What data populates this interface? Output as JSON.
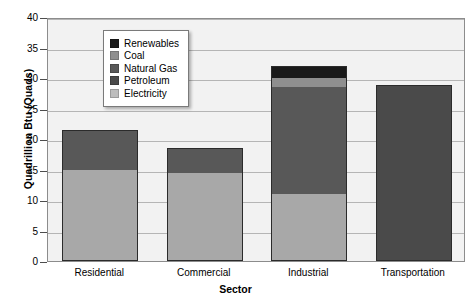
{
  "chart_data": {
    "type": "bar",
    "subtype": "stacked",
    "title": "",
    "xlabel": "Sector",
    "ylabel": "Quadrillion Btu (Quads)",
    "categories": [
      "Residential",
      "Commercial",
      "Industrial",
      "Transportation"
    ],
    "ylim": [
      0,
      40
    ],
    "yticks": [
      0,
      5,
      10,
      15,
      20,
      25,
      30,
      35,
      40
    ],
    "grid": true,
    "legend_position": "upper-left-inside",
    "series": [
      {
        "name": "Electricity",
        "color": "#a8a8a8",
        "values": [
          15.0,
          14.5,
          11.0,
          0.0
        ]
      },
      {
        "name": "Petroleum",
        "color": "#4a4a4a",
        "values": [
          0.0,
          0.0,
          0.0,
          28.8
        ]
      },
      {
        "name": "Natural Gas",
        "color": "#585858",
        "values": [
          6.5,
          4.0,
          17.5,
          0.0
        ]
      },
      {
        "name": "Coal",
        "color": "#8f8f8f",
        "values": [
          0.0,
          0.0,
          1.5,
          0.0
        ]
      },
      {
        "name": "Renewables",
        "color": "#1a1a1a",
        "values": [
          0.0,
          0.0,
          2.0,
          0.0
        ]
      }
    ],
    "totals": [
      21.5,
      18.5,
      32.0,
      28.8
    ]
  },
  "legend": {
    "items": [
      {
        "label": "Renewables",
        "color": "#1a1a1a"
      },
      {
        "label": "Coal",
        "color": "#8f8f8f"
      },
      {
        "label": "Natural Gas",
        "color": "#585858"
      },
      {
        "label": "Petroleum",
        "color": "#4a4a4a"
      },
      {
        "label": "Electricity",
        "color": "#bdbdbd"
      }
    ]
  }
}
